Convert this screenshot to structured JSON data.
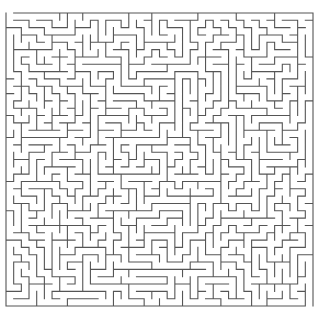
{
  "maze": {
    "cols": 40,
    "rows": 40,
    "left": 6,
    "top": 13,
    "right": 313,
    "bottom": 306,
    "seed": 20240611,
    "wall_color": "#555555",
    "wall_width": 1.1,
    "background": "#ffffff"
  }
}
